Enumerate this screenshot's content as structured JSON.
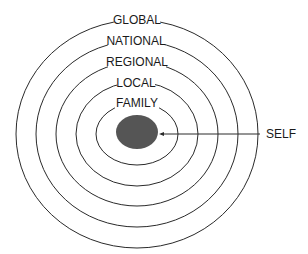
{
  "diagram": {
    "type": "concentric-circles",
    "rings": [
      {
        "label": "GLOBAL",
        "cx": 137,
        "cy": 134,
        "rx": 121,
        "ry": 114
      },
      {
        "label": "NATIONAL",
        "cx": 137,
        "cy": 134,
        "rx": 101,
        "ry": 93
      },
      {
        "label": "REGIONAL",
        "cx": 137,
        "cy": 134,
        "rx": 81,
        "ry": 72
      },
      {
        "label": "LOCAL",
        "cx": 137,
        "cy": 134,
        "rx": 61,
        "ry": 52
      },
      {
        "label": "FAMILY",
        "cx": 137,
        "cy": 134,
        "rx": 41,
        "ry": 31
      }
    ],
    "center": {
      "label": "SELF",
      "fill": "#555555"
    },
    "line_color": "#2a2a2a"
  }
}
